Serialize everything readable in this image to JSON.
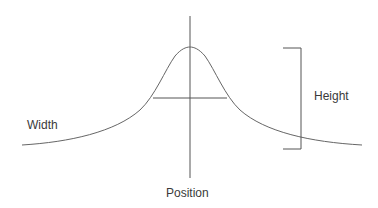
{
  "diagram": {
    "type": "peak-profile",
    "curve": "lorentzian-like peak",
    "labels": {
      "width": "Width",
      "height": "Height",
      "position": "Position"
    },
    "colors": {
      "line": "#555555",
      "text": "#3a3a3a",
      "background": "#ffffff"
    }
  }
}
